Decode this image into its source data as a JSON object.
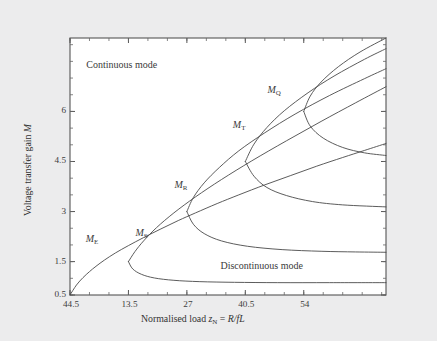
{
  "figure": {
    "background_color": "#ececed",
    "plot_background_color": "#ffffff",
    "frame_color": "#555555",
    "curve_color": "#4a4a4a"
  },
  "chart_data": {
    "type": "line",
    "title": "",
    "xlabel": "Normalised load z_N = R/fL",
    "ylabel": "Voltage transfer gain M",
    "xlabel_parts": {
      "prefix": "Normalised load ",
      "var": "z",
      "var_sub": "N",
      "equals": " = ",
      "expr": "R/fL"
    },
    "ylabel_parts": {
      "prefix": "Voltage transfer gain ",
      "var": "M"
    },
    "grid": false,
    "legend": "none",
    "xticks": [
      "44.5",
      "13.5",
      "27",
      "40.5",
      "54"
    ],
    "xtick_positions": [
      0,
      13.5,
      27,
      40.5,
      54
    ],
    "xlim": [
      0,
      73
    ],
    "yticks": [
      "0.5",
      "1.5",
      "3",
      "4.5",
      "6"
    ],
    "ytick_values": [
      0.5,
      1.5,
      3,
      4.5,
      6
    ],
    "ylim": [
      0.5,
      8.2
    ],
    "annotations": [
      {
        "name": "continuous-mode",
        "text": "Continuous mode",
        "x": 13.0,
        "y": 7.35
      },
      {
        "name": "discontinuous-mode",
        "text": "Discontinuous mode",
        "x": 44.0,
        "y": 1.35
      }
    ],
    "series": [
      {
        "name": "M_E",
        "label": "M",
        "label_sub": "E",
        "label_x": 5.0,
        "label_y": 2.15,
        "description": "Continuous-mode boundary curve rising from origin",
        "points": [
          [
            0.0,
            0.5
          ],
          [
            1.5,
            0.8
          ],
          [
            3.0,
            1.02
          ],
          [
            4.5,
            1.2
          ],
          [
            6.0,
            1.36
          ],
          [
            8.0,
            1.55
          ],
          [
            10.5,
            1.76
          ],
          [
            13.5,
            1.98
          ],
          [
            17.0,
            2.22
          ],
          [
            21.0,
            2.48
          ],
          [
            25.0,
            2.73
          ],
          [
            29.0,
            2.96
          ],
          [
            34.0,
            3.24
          ],
          [
            39.0,
            3.5
          ],
          [
            45.0,
            3.8
          ],
          [
            51.0,
            4.08
          ],
          [
            57.0,
            4.36
          ],
          [
            63.0,
            4.62
          ],
          [
            68.0,
            4.83
          ],
          [
            73.0,
            5.04
          ]
        ]
      },
      {
        "name": "M_S",
        "label": "M",
        "label_sub": "S",
        "label_x": 16.5,
        "label_y": 2.32,
        "nose": [
          13.5,
          1.5
        ],
        "upper_points": [
          [
            13.5,
            1.5
          ],
          [
            15.0,
            1.8
          ],
          [
            17.0,
            2.12
          ],
          [
            20.0,
            2.52
          ],
          [
            24.0,
            2.96
          ],
          [
            29.0,
            3.44
          ],
          [
            35.0,
            3.96
          ],
          [
            42.0,
            4.52
          ],
          [
            50.0,
            5.12
          ],
          [
            58.0,
            5.7
          ],
          [
            66.0,
            6.26
          ],
          [
            73.0,
            6.74
          ]
        ],
        "lower_points": [
          [
            13.5,
            1.5
          ],
          [
            14.5,
            1.28
          ],
          [
            16.5,
            1.12
          ],
          [
            19.5,
            1.01
          ],
          [
            24.0,
            0.94
          ],
          [
            30.0,
            0.9
          ],
          [
            38.0,
            0.88
          ],
          [
            48.0,
            0.87
          ],
          [
            60.0,
            0.87
          ],
          [
            73.0,
            0.87
          ]
        ]
      },
      {
        "name": "M_R",
        "label": "M",
        "label_sub": "R",
        "label_x": 25.5,
        "label_y": 3.77,
        "nose": [
          27.0,
          3.0
        ],
        "upper_points": [
          [
            27.0,
            3.0
          ],
          [
            28.5,
            3.42
          ],
          [
            31.0,
            3.86
          ],
          [
            34.5,
            4.32
          ],
          [
            39.0,
            4.82
          ],
          [
            45.0,
            5.36
          ],
          [
            52.0,
            5.92
          ],
          [
            60.0,
            6.48
          ],
          [
            68.0,
            6.98
          ],
          [
            73.0,
            7.28
          ]
        ],
        "lower_points": [
          [
            27.0,
            3.0
          ],
          [
            28.5,
            2.62
          ],
          [
            31.0,
            2.34
          ],
          [
            35.0,
            2.12
          ],
          [
            41.0,
            1.96
          ],
          [
            49.0,
            1.86
          ],
          [
            58.0,
            1.81
          ],
          [
            66.0,
            1.79
          ],
          [
            73.0,
            1.78
          ]
        ]
      },
      {
        "name": "M_T",
        "label": "M",
        "label_sub": "T",
        "label_x": 39.0,
        "label_y": 5.55,
        "nose": [
          40.5,
          4.5
        ],
        "upper_points": [
          [
            40.5,
            4.5
          ],
          [
            42.5,
            5.02
          ],
          [
            45.5,
            5.52
          ],
          [
            49.5,
            6.02
          ],
          [
            55.0,
            6.56
          ],
          [
            61.0,
            7.06
          ],
          [
            68.0,
            7.56
          ],
          [
            73.0,
            7.88
          ]
        ],
        "lower_points": [
          [
            40.5,
            4.5
          ],
          [
            42.5,
            4.06
          ],
          [
            45.5,
            3.72
          ],
          [
            50.0,
            3.48
          ],
          [
            56.0,
            3.3
          ],
          [
            63.0,
            3.2
          ],
          [
            73.0,
            3.14
          ]
        ]
      },
      {
        "name": "M_Q",
        "label": "M",
        "label_sub": "Q",
        "label_x": 47.0,
        "label_y": 6.62,
        "nose": [
          54.0,
          6.0
        ],
        "upper_points": [
          [
            54.0,
            6.0
          ],
          [
            55.5,
            6.46
          ],
          [
            58.0,
            6.88
          ],
          [
            62.0,
            7.34
          ],
          [
            67.0,
            7.78
          ],
          [
            73.0,
            8.2
          ]
        ],
        "lower_points": [
          [
            54.0,
            6.0
          ],
          [
            55.5,
            5.56
          ],
          [
            58.5,
            5.2
          ],
          [
            63.0,
            4.92
          ],
          [
            68.0,
            4.76
          ],
          [
            73.0,
            4.68
          ]
        ]
      }
    ]
  }
}
